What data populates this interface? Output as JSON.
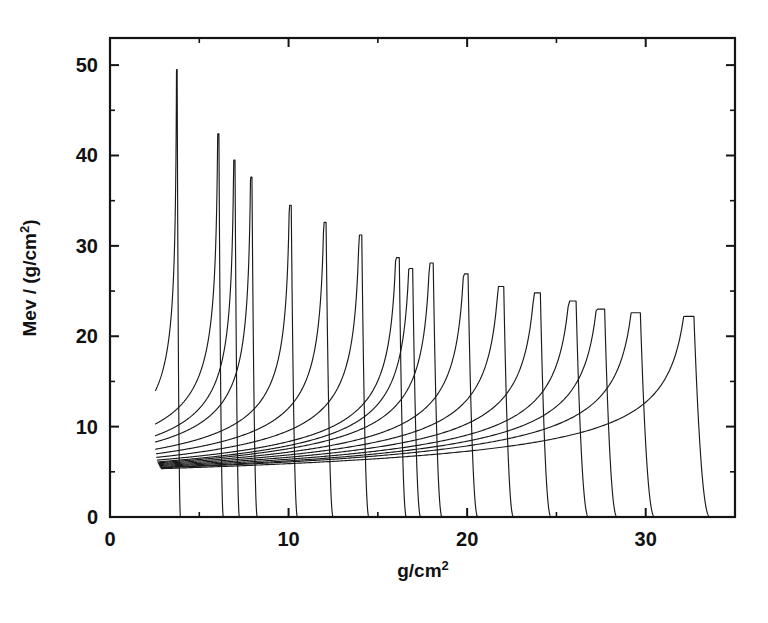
{
  "chart_data": {
    "type": "line",
    "title": "",
    "subtitle": "",
    "xlabel": "g/cm2",
    "xlabel_base": "g/cm",
    "xlabel_sup": "2",
    "ylabel": "Mev / (g/cm2)",
    "ylabel_base_1": "Mev / (g/cm",
    "ylabel_sup": "2",
    "ylabel_base_2": ")",
    "xlim": [
      0,
      35
    ],
    "ylim": [
      0,
      53
    ],
    "x_ticks": [
      0,
      10,
      20,
      30
    ],
    "x_tick_labels": [
      "0",
      "10",
      "20",
      "30"
    ],
    "x_minor_ticks": [
      5,
      15,
      25
    ],
    "y_ticks": [
      0,
      10,
      20,
      30,
      40,
      50
    ],
    "y_tick_labels": [
      "0",
      "10",
      "20",
      "30",
      "40",
      "50"
    ],
    "y_minor_ticks": [
      5,
      15,
      25,
      35,
      45
    ],
    "grid": false,
    "legend": "none",
    "line_color": "#1a1a1a",
    "background_color": "#ffffff",
    "series_description": "Proton Bragg depth-dose curves: stopping power versus areal depth for a family of beam energies",
    "series": [
      {
        "name": "curve-1",
        "entry_x": 2.55,
        "entry_y": 14.0,
        "peak_x": 3.76,
        "peak_y": 49.5,
        "end_x": 3.95
      },
      {
        "name": "curve-2",
        "entry_x": 2.55,
        "entry_y": 10.3,
        "peak_x": 6.1,
        "peak_y": 42.4,
        "end_x": 6.35
      },
      {
        "name": "curve-3",
        "entry_x": 2.55,
        "entry_y": 9.0,
        "peak_x": 7.0,
        "peak_y": 39.5,
        "end_x": 7.25
      },
      {
        "name": "curve-4",
        "entry_x": 2.55,
        "entry_y": 8.3,
        "peak_x": 7.95,
        "peak_y": 37.6,
        "end_x": 8.25
      },
      {
        "name": "curve-5",
        "entry_x": 2.55,
        "entry_y": 7.5,
        "peak_x": 10.15,
        "peak_y": 34.5,
        "end_x": 10.5
      },
      {
        "name": "curve-6",
        "entry_x": 2.6,
        "entry_y": 7.0,
        "peak_x": 12.1,
        "peak_y": 32.6,
        "end_x": 12.5
      },
      {
        "name": "curve-7",
        "entry_x": 2.62,
        "entry_y": 6.6,
        "peak_x": 14.1,
        "peak_y": 31.2,
        "end_x": 14.5
      },
      {
        "name": "curve-8",
        "entry_x": 2.65,
        "entry_y": 6.3,
        "peak_x": 16.2,
        "peak_y": 28.7,
        "end_x": 16.6
      },
      {
        "name": "curve-9",
        "entry_x": 2.68,
        "entry_y": 6.1,
        "peak_x": 16.95,
        "peak_y": 27.5,
        "end_x": 17.4
      },
      {
        "name": "curve-10",
        "entry_x": 2.7,
        "entry_y": 6.0,
        "peak_x": 18.1,
        "peak_y": 28.1,
        "end_x": 18.6
      },
      {
        "name": "curve-11",
        "entry_x": 2.72,
        "entry_y": 5.9,
        "peak_x": 20.05,
        "peak_y": 26.9,
        "end_x": 20.6
      },
      {
        "name": "curve-12",
        "entry_x": 2.75,
        "entry_y": 5.8,
        "peak_x": 22.05,
        "peak_y": 25.5,
        "end_x": 22.6
      },
      {
        "name": "curve-13",
        "entry_x": 2.78,
        "entry_y": 5.7,
        "peak_x": 24.1,
        "peak_y": 24.8,
        "end_x": 24.7
      },
      {
        "name": "curve-14",
        "entry_x": 2.8,
        "entry_y": 5.6,
        "peak_x": 26.1,
        "peak_y": 23.9,
        "end_x": 26.8
      },
      {
        "name": "curve-15",
        "entry_x": 2.82,
        "entry_y": 5.5,
        "peak_x": 27.7,
        "peak_y": 23.0,
        "end_x": 28.4
      },
      {
        "name": "curve-16",
        "entry_x": 2.85,
        "entry_y": 5.45,
        "peak_x": 29.7,
        "peak_y": 22.6,
        "end_x": 30.5
      },
      {
        "name": "curve-17",
        "entry_x": 2.88,
        "entry_y": 5.35,
        "peak_x": 32.7,
        "peak_y": 22.2,
        "end_x": 33.6
      }
    ]
  }
}
